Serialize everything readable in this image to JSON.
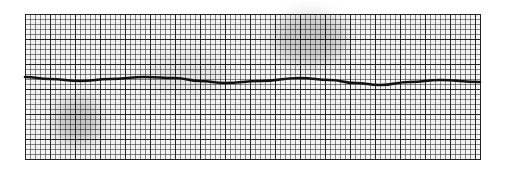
{
  "chart_data": {
    "type": "line",
    "title": "",
    "xlabel": "",
    "ylabel": "",
    "grid": true,
    "series": [
      {
        "name": "trace",
        "points": [
          [
            25,
            77
          ],
          [
            50,
            79
          ],
          [
            80,
            81
          ],
          [
            110,
            79
          ],
          [
            145,
            77
          ],
          [
            175,
            78
          ],
          [
            200,
            81
          ],
          [
            225,
            83
          ],
          [
            260,
            81
          ],
          [
            300,
            78
          ],
          [
            330,
            80
          ],
          [
            355,
            83
          ],
          [
            380,
            85
          ],
          [
            410,
            82
          ],
          [
            440,
            80
          ],
          [
            480,
            82
          ]
        ]
      }
    ],
    "plot_area": {
      "x": 25,
      "y": 14,
      "width": 455,
      "height": 145
    },
    "minor_grid_px": 5,
    "major_grid_px": 25,
    "colors": {
      "grid": "#222222",
      "trace": "#111111",
      "paper": "#f4f4f4"
    }
  }
}
